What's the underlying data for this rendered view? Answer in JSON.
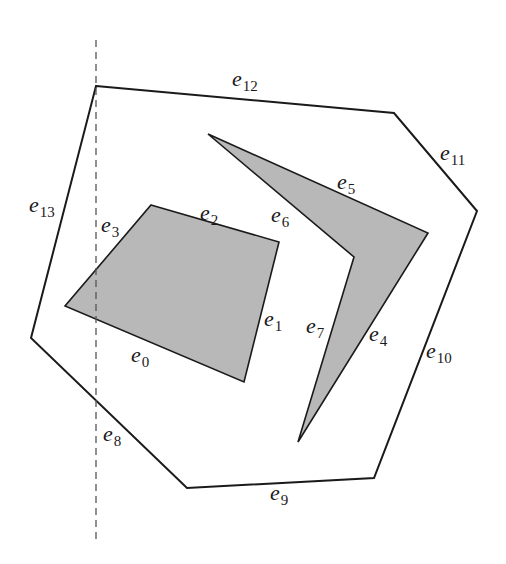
{
  "figure": {
    "type": "polygon with holes (edge-labelled)",
    "colors": {
      "stroke": "#1a1a1a",
      "hole_fill": "#b8b8b8",
      "sweep_line": "#555555",
      "background": "#ffffff"
    },
    "sweep_line": {
      "x": 96,
      "y1": 40,
      "y2": 540,
      "style": "dashed"
    },
    "outer_polygon": {
      "points": [
        [
          96,
          86
        ],
        [
          394,
          113
        ],
        [
          477,
          211
        ],
        [
          374,
          478
        ],
        [
          187,
          488
        ],
        [
          31,
          338
        ]
      ],
      "edges": [
        "e12",
        "e11",
        "e10",
        "e9",
        "e8",
        "e13"
      ]
    },
    "holes": [
      {
        "name": "quadrilateral-hole",
        "points": [
          [
            151,
            205
          ],
          [
            279,
            242
          ],
          [
            244,
            382
          ],
          [
            65,
            306
          ]
        ],
        "edges": [
          "e2",
          "e1",
          "e0",
          "e3"
        ]
      },
      {
        "name": "chevron-hole",
        "points": [
          [
            208,
            134
          ],
          [
            428,
            233
          ],
          [
            298,
            442
          ],
          [
            354,
            257
          ]
        ],
        "edges": [
          "e5",
          "e4",
          "e7",
          "e6"
        ]
      }
    ],
    "labels": [
      {
        "id": "e0",
        "base": "e",
        "sub": "0",
        "x": 131,
        "y": 362
      },
      {
        "id": "e1",
        "base": "e",
        "sub": "1",
        "x": 264,
        "y": 326
      },
      {
        "id": "e2",
        "base": "e",
        "sub": "2",
        "x": 200,
        "y": 220
      },
      {
        "id": "e3",
        "base": "e",
        "sub": "3",
        "x": 101,
        "y": 232
      },
      {
        "id": "e4",
        "base": "e",
        "sub": "4",
        "x": 369,
        "y": 341
      },
      {
        "id": "e5",
        "base": "e",
        "sub": "5",
        "x": 337,
        "y": 189
      },
      {
        "id": "e6",
        "base": "e",
        "sub": "6",
        "x": 271,
        "y": 222
      },
      {
        "id": "e7",
        "base": "e",
        "sub": "7",
        "x": 306,
        "y": 333
      },
      {
        "id": "e8",
        "base": "e",
        "sub": "8",
        "x": 103,
        "y": 441
      },
      {
        "id": "e9",
        "base": "e",
        "sub": "9",
        "x": 270,
        "y": 500
      },
      {
        "id": "e10",
        "base": "e",
        "sub": "10",
        "x": 426,
        "y": 358
      },
      {
        "id": "e11",
        "base": "e",
        "sub": "11",
        "x": 440,
        "y": 160
      },
      {
        "id": "e12",
        "base": "e",
        "sub": "12",
        "x": 232,
        "y": 86
      },
      {
        "id": "e13",
        "base": "e",
        "sub": "13",
        "x": 29,
        "y": 212
      }
    ]
  }
}
